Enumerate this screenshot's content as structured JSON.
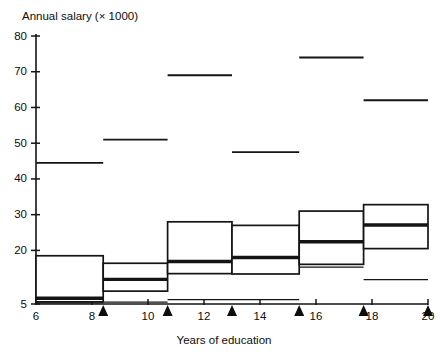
{
  "chart_data": {
    "type": "box",
    "title": "Annual salary (× 1000)",
    "xlabel": "Years of education",
    "ylabel": "Annual salary (× 1000)",
    "xlim": [
      6,
      20
    ],
    "ylim": [
      5,
      80
    ],
    "grid": false,
    "legend": "none",
    "y_ticks": [
      5,
      20,
      30,
      40,
      50,
      60,
      70,
      80
    ],
    "y_tick_labels": [
      "5",
      "20",
      "30",
      "40",
      "50",
      "60",
      "70",
      "80"
    ],
    "x_ticks": [
      6,
      8,
      10,
      12,
      14,
      16,
      18,
      20
    ],
    "x_tick_labels": [
      "6",
      "8",
      "10",
      "12",
      "14",
      "16",
      "18",
      "20"
    ],
    "group_boundaries": [
      6,
      8.4,
      10.7,
      13.0,
      15.4,
      17.7,
      20
    ],
    "marker_positions": [
      8.4,
      10.7,
      13.0,
      15.4,
      17.7,
      20
    ],
    "boxes": [
      {
        "label": "6-8.4",
        "x_start": 6,
        "x_end": 8.4,
        "whisker_low": 5.3,
        "q1": 5.6,
        "median": 6.6,
        "q3": 18.5,
        "whisker_high": 44.5,
        "whisker_high_x_end": 8.4,
        "whisker_low_x_end": 8.4
      },
      {
        "label": "8.4-10.7",
        "x_start": 8.4,
        "x_end": 10.7,
        "whisker_low": 5.5,
        "q1": 8.6,
        "median": 11.9,
        "q3": 16.4,
        "whisker_high": 51.0,
        "whisker_high_x_end": 10.7,
        "whisker_low_x_end": 10.7
      },
      {
        "label": "10.7-13.0",
        "x_start": 10.7,
        "x_end": 13.0,
        "whisker_low": 6.2,
        "q1": 13.5,
        "median": 16.9,
        "q3": 28.0,
        "whisker_high": 69.0,
        "whisker_high_x_end": 13.0,
        "whisker_low_x_end": 13.0
      },
      {
        "label": "13.0-15.4",
        "x_start": 13.0,
        "x_end": 15.4,
        "whisker_low": 6.2,
        "q1": 13.4,
        "median": 18.0,
        "q3": 27.0,
        "whisker_high": 47.5,
        "whisker_high_x_end": 15.4,
        "whisker_low_x_end": 15.4
      },
      {
        "label": "15.4-17.7",
        "x_start": 15.4,
        "x_end": 17.7,
        "whisker_low": 15.3,
        "q1": 16.1,
        "median": 22.4,
        "q3": 31.0,
        "whisker_high": 74.0,
        "whisker_high_x_end": 17.7,
        "whisker_low_x_end": 17.7
      },
      {
        "label": "17.7-20",
        "x_start": 17.7,
        "x_end": 20,
        "whisker_low": 11.8,
        "q1": 20.5,
        "median": 27.1,
        "q3": 32.8,
        "whisker_high": 62.0,
        "whisker_high_x_end": 20,
        "whisker_low_x_end": 20
      }
    ]
  },
  "colors": {
    "ink": "#141414",
    "background": "#ffffff"
  }
}
